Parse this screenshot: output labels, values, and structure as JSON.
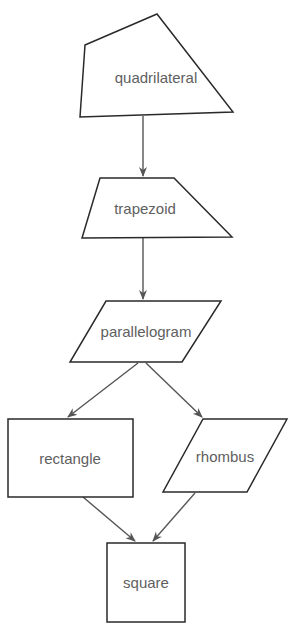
{
  "diagram": {
    "type": "flowchart-hierarchy",
    "colors": {
      "background": "#ffffff",
      "shape_stroke": "#2a2a2a",
      "edge_stroke": "#555555",
      "label_text": "#606060"
    },
    "nodes": [
      {
        "id": "quadrilateral",
        "label": "quadrilateral",
        "shape": "irregular-quadrilateral"
      },
      {
        "id": "trapezoid",
        "label": "trapezoid",
        "shape": "trapezoid"
      },
      {
        "id": "parallelogram",
        "label": "parallelogram",
        "shape": "parallelogram"
      },
      {
        "id": "rectangle",
        "label": "rectangle",
        "shape": "rectangle"
      },
      {
        "id": "rhombus",
        "label": "rhombus",
        "shape": "rhombus"
      },
      {
        "id": "square",
        "label": "square",
        "shape": "square"
      }
    ],
    "edges": [
      {
        "from": "quadrilateral",
        "to": "trapezoid"
      },
      {
        "from": "trapezoid",
        "to": "parallelogram"
      },
      {
        "from": "parallelogram",
        "to": "rectangle"
      },
      {
        "from": "parallelogram",
        "to": "rhombus"
      },
      {
        "from": "rectangle",
        "to": "square"
      },
      {
        "from": "rhombus",
        "to": "square"
      }
    ]
  }
}
